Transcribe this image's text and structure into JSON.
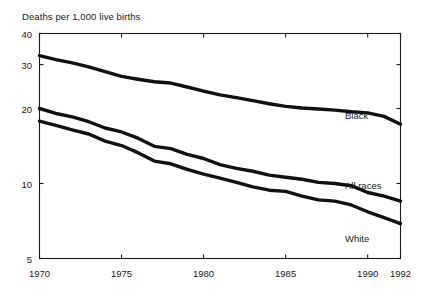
{
  "chart_data": {
    "type": "line",
    "title": "Deaths per 1,000 live births",
    "xlabel": "",
    "ylabel": "",
    "yscale": "log",
    "ylim": [
      5,
      40
    ],
    "xlim": [
      1970,
      1992
    ],
    "grid": false,
    "legend_position": "inline-right",
    "ytick_labels": [
      "40",
      "30",
      "20",
      "10",
      "5"
    ],
    "ytick_values": [
      40,
      30,
      20,
      10,
      5
    ],
    "xtick_labels": [
      "1970",
      "1975",
      "1980",
      "1985",
      "1990",
      "1992"
    ],
    "xtick_values": [
      1970,
      1975,
      1980,
      1985,
      1990,
      1992
    ],
    "x": [
      1970,
      1971,
      1972,
      1973,
      1974,
      1975,
      1976,
      1977,
      1978,
      1979,
      1980,
      1981,
      1982,
      1983,
      1984,
      1985,
      1986,
      1987,
      1988,
      1989,
      1990,
      1991,
      1992
    ],
    "series": [
      {
        "name": "Black",
        "values": [
          32.6,
          31.4,
          30.5,
          29.4,
          28.1,
          26.9,
          26.2,
          25.6,
          25.3,
          24.4,
          23.5,
          22.7,
          22.1,
          21.5,
          20.9,
          20.4,
          20.1,
          19.9,
          19.7,
          19.4,
          19.2,
          18.6,
          17.3
        ]
      },
      {
        "name": "All races",
        "values": [
          20.0,
          19.1,
          18.5,
          17.7,
          16.7,
          16.1,
          15.2,
          14.1,
          13.8,
          13.1,
          12.6,
          11.9,
          11.5,
          11.2,
          10.8,
          10.6,
          10.4,
          10.1,
          10.0,
          9.8,
          9.2,
          8.9,
          8.5
        ]
      },
      {
        "name": "White",
        "values": [
          17.8,
          17.1,
          16.4,
          15.8,
          14.8,
          14.2,
          13.3,
          12.3,
          12.0,
          11.4,
          10.9,
          10.5,
          10.1,
          9.7,
          9.4,
          9.3,
          8.9,
          8.6,
          8.5,
          8.2,
          7.7,
          7.3,
          6.9
        ]
      }
    ]
  },
  "labels": {
    "black": "Black",
    "all_races": "All races",
    "white": "White"
  }
}
